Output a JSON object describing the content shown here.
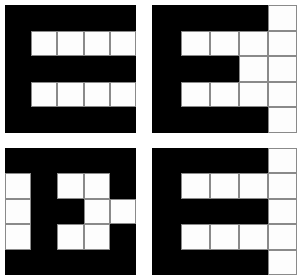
{
  "canvas": {
    "width": 302,
    "height": 280,
    "background_color": "#ffffff",
    "foreground_color": "#000000",
    "gridline_color": "#8a8a8a"
  },
  "layout": {
    "arrangement": "2x2 quadrants",
    "grid_rows": 5,
    "grid_cols": 5,
    "gap_description": "white cross-shaped gutter between quadrants"
  },
  "quadrants": [
    {
      "id": "top-left",
      "name": "glyph-e-variant-a",
      "rows": 5,
      "cols": 5,
      "cells": [
        [
          "black",
          "black",
          "black",
          "black",
          "black"
        ],
        [
          "black",
          "white",
          "white",
          "white",
          "white"
        ],
        [
          "black",
          "black",
          "black",
          "black",
          "black"
        ],
        [
          "black",
          "white",
          "white",
          "white",
          "white"
        ],
        [
          "black",
          "black",
          "black",
          "black",
          "black"
        ]
      ]
    },
    {
      "id": "top-right",
      "name": "glyph-e-variant-b",
      "rows": 5,
      "cols": 5,
      "cells": [
        [
          "black",
          "black",
          "black",
          "black",
          "white"
        ],
        [
          "black",
          "white",
          "white",
          "white",
          "white"
        ],
        [
          "black",
          "black",
          "black",
          "white",
          "white"
        ],
        [
          "black",
          "white",
          "white",
          "white",
          "white"
        ],
        [
          "black",
          "black",
          "black",
          "black",
          "white"
        ]
      ]
    },
    {
      "id": "bottom-left",
      "name": "glyph-e-variant-c",
      "rows": 5,
      "cols": 5,
      "cells": [
        [
          "black",
          "black",
          "black",
          "black",
          "black"
        ],
        [
          "white",
          "black",
          "white",
          "white",
          "black"
        ],
        [
          "white",
          "black",
          "black",
          "white",
          "white"
        ],
        [
          "white",
          "black",
          "white",
          "white",
          "black"
        ],
        [
          "black",
          "black",
          "black",
          "black",
          "black"
        ]
      ]
    },
    {
      "id": "bottom-right",
      "name": "glyph-e-variant-d",
      "rows": 5,
      "cols": 5,
      "cells": [
        [
          "black",
          "black",
          "black",
          "black",
          "white"
        ],
        [
          "black",
          "white",
          "white",
          "white",
          "white"
        ],
        [
          "black",
          "black",
          "black",
          "black",
          "white"
        ],
        [
          "black",
          "white",
          "white",
          "white",
          "white"
        ],
        [
          "black",
          "black",
          "black",
          "black",
          "white"
        ]
      ]
    }
  ]
}
